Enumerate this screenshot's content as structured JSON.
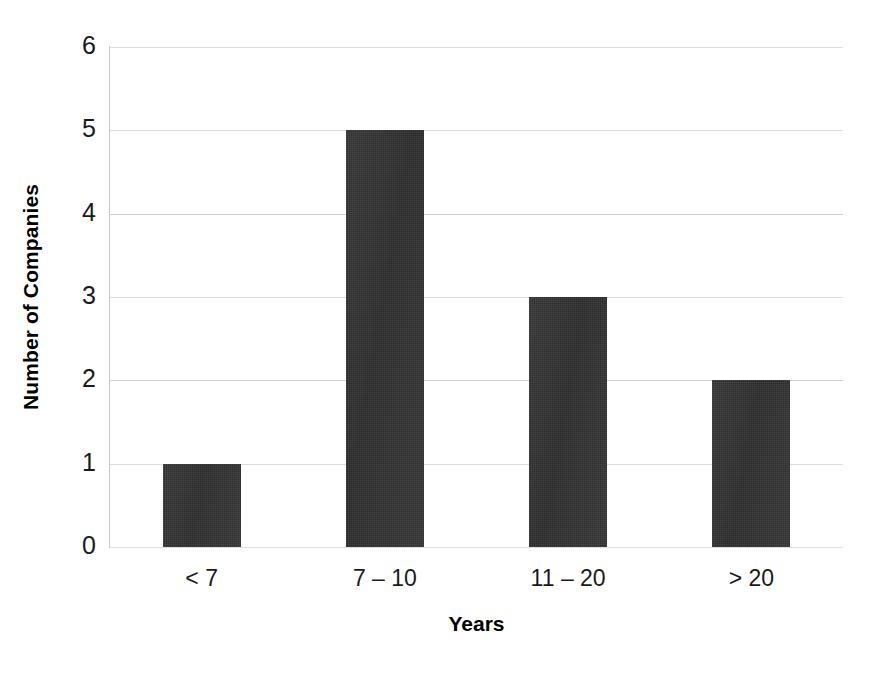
{
  "chart_data": {
    "type": "bar",
    "title": "",
    "subtitle": "",
    "xlabel": "Years",
    "ylabel": "Number of Companies",
    "categories": [
      "< 7",
      "7 – 10",
      "11 – 20",
      "> 20"
    ],
    "values": [
      1,
      5,
      3,
      2
    ],
    "series": [
      {
        "name": "Number of Companies",
        "values": [
          1,
          5,
          3,
          2
        ]
      }
    ],
    "ylim": [
      0,
      6
    ],
    "y_ticks": [
      "0",
      "1",
      "2",
      "3",
      "4",
      "5",
      "6"
    ],
    "y_tick_values": [
      0,
      1,
      2,
      3,
      4,
      5,
      6
    ],
    "grid": true,
    "grid_axis": "y",
    "legend": false,
    "legend_position": "none",
    "annotations": [],
    "colors": {
      "bar_fill": "#2b2b2b",
      "gridline": "#cfcfcf",
      "axis_line": "#c9c9c9",
      "text": "#1a1a1a",
      "background": "#ffffff"
    }
  }
}
